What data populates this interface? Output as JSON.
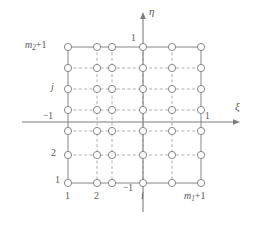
{
  "figure": {
    "type": "grid-diagram",
    "colors": {
      "axis": "#7d7d80",
      "solid_grid": "#86868a",
      "dashed_grid": "#9a9a9e",
      "node_stroke": "#7a7a7e",
      "node_fill": "#ffffff",
      "text": "#57575a",
      "background": "#ffffff"
    },
    "axes": {
      "horizontal": {
        "name": "xi",
        "symbol": "ξ",
        "arrow": true,
        "y": 122,
        "x_start": 22,
        "x_end": 240,
        "label_x": 236,
        "label_y": 104
      },
      "vertical": {
        "name": "eta",
        "symbol": "η",
        "arrow": true,
        "x": 143,
        "y_start": 13,
        "y_end": 212,
        "label_x": 149,
        "label_y": 10
      }
    },
    "grid": {
      "columns": 6,
      "rows": 7,
      "node_x": [
        68,
        97,
        112,
        143,
        172,
        201
      ],
      "node_y": [
        47,
        68,
        89,
        110,
        131,
        155,
        183
      ],
      "node_radius": 3.6,
      "boundary": {
        "left_x": 68,
        "right_x": 201,
        "top_y": 47,
        "bottom_y": 183
      },
      "solid_lines": "outer boundary rectangle",
      "dashed_lines": "interior grid lines"
    },
    "labels": {
      "axis_xi": "ξ",
      "axis_eta": "η",
      "eta_top_tick": "1",
      "eta_bottom_tick": "−1",
      "xi_right_tick": "1",
      "xi_left_tick": "−1",
      "row_top": "m₂+1",
      "row_top_base": "m",
      "row_top_sub": "2",
      "row_top_suffix": "+1",
      "row_j": "j",
      "row_two": "2",
      "row_one": "1",
      "col_one": "1",
      "col_two": "2",
      "col_i": "i",
      "col_last": "m₁+1",
      "col_last_base": "m",
      "col_last_sub": "1",
      "col_last_suffix": "+1"
    },
    "label_positions": {
      "row_top": {
        "x": 26,
        "y": 41
      },
      "row_j": {
        "x": 52,
        "y": 84
      },
      "row_minus_one": {
        "x": 46,
        "y": 114
      },
      "row_two": {
        "x": 52,
        "y": 150
      },
      "row_one": {
        "x": 55,
        "y": 177
      },
      "eta_top_tick": {
        "x": 131,
        "y": 38
      },
      "xi_right_tick": {
        "x": 206,
        "y": 114
      },
      "col_one": {
        "x": 65,
        "y": 192
      },
      "col_two": {
        "x": 94,
        "y": 192
      },
      "col_minus_one": {
        "x": 125,
        "y": 186
      },
      "col_i": {
        "x": 141,
        "y": 192
      },
      "col_last": {
        "x": 186,
        "y": 192
      }
    }
  }
}
